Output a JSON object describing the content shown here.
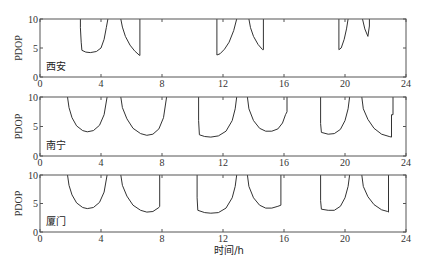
{
  "chart_data": [
    {
      "type": "line",
      "title": "",
      "panel_label": "西安",
      "xlabel": "",
      "ylabel": "PDOP",
      "xlim": [
        0,
        24
      ],
      "ylim": [
        0,
        10
      ],
      "xticks": [
        "0",
        "4",
        "8",
        "12",
        "16",
        "20",
        "24"
      ],
      "yticks": [
        "0",
        "5",
        "10"
      ],
      "segments": [
        [
          [
            2.65,
            10
          ],
          [
            2.65,
            8.5
          ],
          [
            2.7,
            6.0
          ],
          [
            2.75,
            4.6
          ],
          [
            3.0,
            4.3
          ],
          [
            3.3,
            4.2
          ],
          [
            3.7,
            4.4
          ],
          [
            4.0,
            5.0
          ],
          [
            4.2,
            6.5
          ],
          [
            4.35,
            8.5
          ],
          [
            4.45,
            10
          ]
        ],
        [
          [
            5.3,
            10
          ],
          [
            5.4,
            8.6
          ],
          [
            5.6,
            7.0
          ],
          [
            5.9,
            5.5
          ],
          [
            6.2,
            4.5
          ],
          [
            6.5,
            3.8
          ],
          [
            6.55,
            3.7
          ],
          [
            6.55,
            10
          ]
        ],
        [
          [
            11.6,
            10
          ],
          [
            11.6,
            3.8
          ],
          [
            11.8,
            4.0
          ],
          [
            12.1,
            4.8
          ],
          [
            12.4,
            6.0
          ],
          [
            12.7,
            8.0
          ],
          [
            12.9,
            10
          ]
        ],
        [
          [
            13.7,
            10
          ],
          [
            13.8,
            8.5
          ],
          [
            14.0,
            7.0
          ],
          [
            14.3,
            5.6
          ],
          [
            14.6,
            4.7
          ],
          [
            14.65,
            4.7
          ],
          [
            14.65,
            10
          ]
        ],
        [
          [
            19.6,
            10
          ],
          [
            19.6,
            4.7
          ],
          [
            19.75,
            5.0
          ],
          [
            19.95,
            6.5
          ],
          [
            20.1,
            8.3
          ],
          [
            20.2,
            10
          ]
        ],
        [
          [
            21.15,
            10
          ],
          [
            21.3,
            8.3
          ],
          [
            21.5,
            7.0
          ],
          [
            21.6,
            8.8
          ],
          [
            21.6,
            10
          ]
        ]
      ]
    },
    {
      "type": "line",
      "title": "",
      "panel_label": "南宁",
      "xlabel": "",
      "ylabel": "PDOP",
      "xlim": [
        0,
        24
      ],
      "ylim": [
        0,
        10
      ],
      "xticks": [
        "0",
        "4",
        "8",
        "12",
        "16",
        "20",
        "24"
      ],
      "yticks": [
        "0",
        "5",
        "10"
      ],
      "segments": [
        [
          [
            1.8,
            10
          ],
          [
            1.9,
            8.2
          ],
          [
            2.1,
            6.5
          ],
          [
            2.4,
            5.1
          ],
          [
            2.8,
            4.3
          ],
          [
            3.1,
            4.1
          ],
          [
            3.5,
            4.3
          ],
          [
            3.9,
            5.2
          ],
          [
            4.2,
            7.0
          ],
          [
            4.4,
            10
          ]
        ],
        [
          [
            5.3,
            10
          ],
          [
            5.4,
            8.2
          ],
          [
            5.7,
            6.3
          ],
          [
            6.1,
            4.7
          ],
          [
            6.6,
            3.8
          ],
          [
            7.0,
            3.5
          ],
          [
            7.4,
            3.7
          ],
          [
            7.8,
            4.6
          ],
          [
            8.1,
            6.5
          ],
          [
            8.3,
            10
          ]
        ],
        [
          [
            10.4,
            10
          ],
          [
            10.4,
            6.0
          ],
          [
            10.45,
            3.6
          ],
          [
            10.8,
            3.3
          ],
          [
            11.2,
            3.2
          ],
          [
            11.7,
            3.4
          ],
          [
            12.2,
            4.2
          ],
          [
            12.6,
            6.0
          ],
          [
            12.8,
            8.0
          ],
          [
            12.9,
            10
          ]
        ],
        [
          [
            13.6,
            10
          ],
          [
            13.7,
            8.0
          ],
          [
            14.0,
            6.0
          ],
          [
            14.4,
            4.7
          ],
          [
            14.8,
            4.2
          ],
          [
            15.2,
            4.2
          ],
          [
            15.6,
            4.6
          ],
          [
            15.9,
            5.6
          ],
          [
            16.1,
            7.0
          ],
          [
            16.2,
            7.5
          ],
          [
            16.2,
            10
          ]
        ],
        [
          [
            18.4,
            10
          ],
          [
            18.4,
            5.5
          ],
          [
            18.45,
            4.0
          ],
          [
            18.9,
            3.7
          ],
          [
            19.3,
            3.8
          ],
          [
            19.7,
            4.5
          ],
          [
            20.0,
            6.0
          ],
          [
            20.2,
            8.0
          ],
          [
            20.3,
            10
          ]
        ],
        [
          [
            21.1,
            10
          ],
          [
            21.2,
            8.0
          ],
          [
            21.5,
            6.2
          ],
          [
            21.9,
            4.7
          ],
          [
            22.4,
            3.7
          ],
          [
            22.9,
            3.3
          ],
          [
            23.05,
            3.2
          ],
          [
            23.05,
            7.0
          ],
          [
            23.15,
            7.0
          ],
          [
            23.15,
            10
          ]
        ]
      ]
    },
    {
      "type": "line",
      "title": "",
      "panel_label": "厦门",
      "xlabel": "时间/h",
      "ylabel": "PDOP",
      "xlim": [
        0,
        24
      ],
      "ylim": [
        0,
        10
      ],
      "xticks": [
        "0",
        "4",
        "8",
        "12",
        "16",
        "20",
        "24"
      ],
      "yticks": [
        "0",
        "5",
        "10"
      ],
      "segments": [
        [
          [
            1.8,
            10
          ],
          [
            1.9,
            8.2
          ],
          [
            2.1,
            6.5
          ],
          [
            2.4,
            5.1
          ],
          [
            2.8,
            4.3
          ],
          [
            3.1,
            4.1
          ],
          [
            3.5,
            4.3
          ],
          [
            3.9,
            5.2
          ],
          [
            4.2,
            7.0
          ],
          [
            4.4,
            10
          ]
        ],
        [
          [
            5.3,
            10
          ],
          [
            5.4,
            8.2
          ],
          [
            5.7,
            6.3
          ],
          [
            6.1,
            4.7
          ],
          [
            6.6,
            3.8
          ],
          [
            7.0,
            3.5
          ],
          [
            7.4,
            3.6
          ],
          [
            7.8,
            4.3
          ],
          [
            7.85,
            4.5
          ],
          [
            7.85,
            10
          ]
        ],
        [
          [
            10.3,
            10
          ],
          [
            10.3,
            6.0
          ],
          [
            10.35,
            3.8
          ],
          [
            10.8,
            3.4
          ],
          [
            11.2,
            3.3
          ],
          [
            11.7,
            3.4
          ],
          [
            12.2,
            4.2
          ],
          [
            12.6,
            6.0
          ],
          [
            12.8,
            8.0
          ],
          [
            12.9,
            10
          ]
        ],
        [
          [
            13.6,
            10
          ],
          [
            13.7,
            8.0
          ],
          [
            14.0,
            6.0
          ],
          [
            14.4,
            4.7
          ],
          [
            14.8,
            4.2
          ],
          [
            15.2,
            4.2
          ],
          [
            15.6,
            4.5
          ],
          [
            15.8,
            4.7
          ],
          [
            15.8,
            10
          ]
        ],
        [
          [
            18.4,
            10
          ],
          [
            18.4,
            5.5
          ],
          [
            18.45,
            4.0
          ],
          [
            18.9,
            3.8
          ],
          [
            19.3,
            3.8
          ],
          [
            19.7,
            4.5
          ],
          [
            20.0,
            6.0
          ],
          [
            20.2,
            8.0
          ],
          [
            20.3,
            10
          ]
        ],
        [
          [
            21.1,
            10
          ],
          [
            21.2,
            8.0
          ],
          [
            21.5,
            6.2
          ],
          [
            21.9,
            4.8
          ],
          [
            22.4,
            3.9
          ],
          [
            22.8,
            3.6
          ],
          [
            22.85,
            3.5
          ],
          [
            22.85,
            10
          ]
        ]
      ]
    }
  ]
}
